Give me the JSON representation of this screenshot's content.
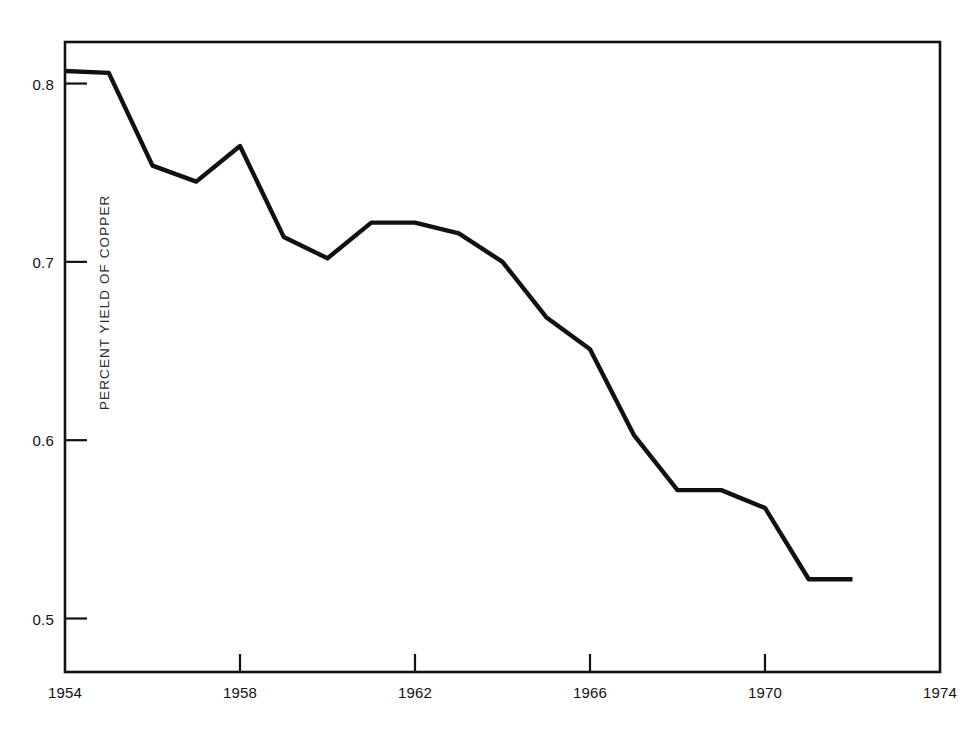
{
  "figure": {
    "background_color": "#ffffff",
    "line_color": "#111111",
    "axis_color": "#111111"
  },
  "chart_data": {
    "type": "line",
    "title": "",
    "subtitle": "",
    "xlabel": "",
    "ylabel": "PERCENT YIELD OF COPPER",
    "x": [
      1954,
      1955,
      1956,
      1957,
      1958,
      1959,
      1960,
      1961,
      1962,
      1963,
      1964,
      1965,
      1966,
      1967,
      1968,
      1969,
      1970,
      1971,
      1972
    ],
    "values": [
      0.807,
      0.806,
      0.754,
      0.745,
      0.765,
      0.714,
      0.702,
      0.722,
      0.722,
      0.716,
      0.7,
      0.669,
      0.651,
      0.603,
      0.572,
      0.572,
      0.562,
      0.522,
      0.522
    ],
    "series": [
      {
        "name": "PERCENT YIELD OF COPPER",
        "values": [
          0.807,
          0.806,
          0.754,
          0.745,
          0.765,
          0.714,
          0.702,
          0.722,
          0.722,
          0.716,
          0.7,
          0.669,
          0.651,
          0.603,
          0.572,
          0.572,
          0.562,
          0.522,
          0.522
        ]
      }
    ],
    "xlim": [
      1954,
      1974
    ],
    "ylim": [
      0.47,
      0.8233
    ],
    "xticks": [
      1954,
      1958,
      1962,
      1966,
      1970,
      1974
    ],
    "xtick_labels": [
      "1954",
      "1958",
      "1962",
      "1966",
      "1970",
      "1974"
    ],
    "yticks": [
      0.5,
      0.6,
      0.7,
      0.8
    ],
    "ytick_labels": [
      "0.5",
      "0.6",
      "0.7",
      "0.8"
    ],
    "grid": false,
    "legend": false,
    "legend_position": "none",
    "annotations": []
  }
}
